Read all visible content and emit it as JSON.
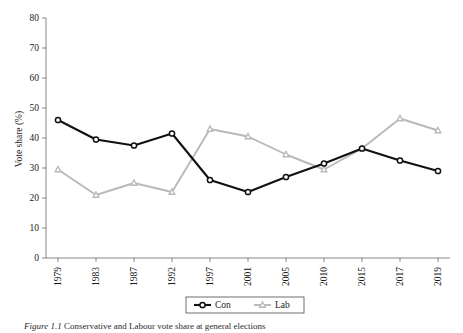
{
  "figure": {
    "caption_label": "Figure 1.1",
    "caption_text": "Conservative and Labour vote share at general elections"
  },
  "axes": {
    "y_title": "Vote share (%)",
    "y_ticks": [
      "0",
      "10",
      "20",
      "30",
      "40",
      "50",
      "60",
      "70",
      "80"
    ],
    "x_ticks": [
      "1979",
      "1983",
      "1987",
      "1992",
      "1997",
      "2001",
      "2005",
      "2010",
      "2015",
      "2017",
      "2019"
    ]
  },
  "legend": {
    "items": [
      {
        "label": "Con",
        "color": "#111111",
        "marker": "circle"
      },
      {
        "label": "Lab",
        "color": "#b9b9b9",
        "marker": "triangle"
      }
    ]
  },
  "chart_data": {
    "type": "line",
    "title": "",
    "xlabel": "",
    "ylabel": "Vote share (%)",
    "xlim": [
      1979,
      2019
    ],
    "ylim": [
      0,
      80
    ],
    "ytick_step": 10,
    "grid": true,
    "grid_axis": "y",
    "legend_position": "bottom-center",
    "x": [
      1979,
      1983,
      1987,
      1992,
      1997,
      2001,
      2005,
      2010,
      2015,
      2017,
      2019
    ],
    "categories": [
      "1979",
      "1983",
      "1987",
      "1992",
      "1997",
      "2001",
      "2005",
      "2010",
      "2015",
      "2017",
      "2019"
    ],
    "series": [
      {
        "name": "Con",
        "color": "#111111",
        "marker": "circle",
        "values": [
          46,
          39.5,
          37.5,
          41.5,
          26,
          22,
          27,
          31.5,
          36.5,
          32.5,
          29
        ]
      },
      {
        "name": "Lab",
        "color": "#b9b9b9",
        "marker": "triangle",
        "values": [
          29.5,
          21,
          25,
          22,
          43,
          40.5,
          34.5,
          29.5,
          36.5,
          46.5,
          42.5
        ]
      }
    ]
  }
}
